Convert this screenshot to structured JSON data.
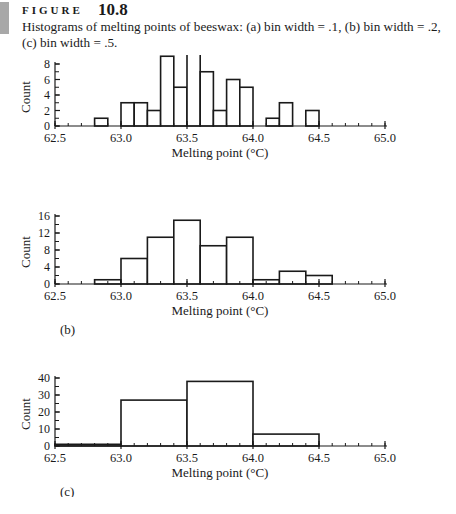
{
  "figure": {
    "label": "FIGURE",
    "number": "10.8",
    "caption": "Histograms of melting points of beeswax: (a) bin width = .1, (b) bin width = .2, (c) bin width = .5."
  },
  "chart_data": [
    {
      "type": "bar",
      "panel": "(a)",
      "title": "",
      "xlabel": "Melting point (°C)",
      "ylabel": "Count",
      "bin_width": 0.1,
      "xlim": [
        62.5,
        65.0
      ],
      "ylim": [
        0,
        10
      ],
      "x_ticks": [
        "62.5",
        "63.0",
        "63.5",
        "64.0",
        "64.5",
        "65.0"
      ],
      "y_ticks": [
        "0",
        "2",
        "4",
        "6",
        "8"
      ],
      "bins": [
        {
          "start": 62.8,
          "count": 1
        },
        {
          "start": 63.0,
          "count": 3
        },
        {
          "start": 63.1,
          "count": 3
        },
        {
          "start": 63.2,
          "count": 2
        },
        {
          "start": 63.3,
          "count": 9
        },
        {
          "start": 63.4,
          "count": 5
        },
        {
          "start": 63.5,
          "count": 10
        },
        {
          "start": 63.6,
          "count": 7
        },
        {
          "start": 63.7,
          "count": 2
        },
        {
          "start": 63.8,
          "count": 6
        },
        {
          "start": 63.9,
          "count": 5
        },
        {
          "start": 64.1,
          "count": 1
        },
        {
          "start": 64.2,
          "count": 3
        },
        {
          "start": 64.4,
          "count": 2
        }
      ]
    },
    {
      "type": "bar",
      "panel": "(b)",
      "title": "",
      "xlabel": "Melting point (°C)",
      "ylabel": "Count",
      "bin_width": 0.2,
      "xlim": [
        62.5,
        65.0
      ],
      "ylim": [
        0,
        16
      ],
      "x_ticks": [
        "62.5",
        "63.0",
        "63.5",
        "64.0",
        "64.5",
        "65.0"
      ],
      "y_ticks": [
        "0",
        "4",
        "8",
        "12",
        "16"
      ],
      "bins": [
        {
          "start": 62.8,
          "count": 1
        },
        {
          "start": 63.0,
          "count": 6
        },
        {
          "start": 63.2,
          "count": 11
        },
        {
          "start": 63.4,
          "count": 15
        },
        {
          "start": 63.6,
          "count": 9
        },
        {
          "start": 63.8,
          "count": 11
        },
        {
          "start": 64.0,
          "count": 1
        },
        {
          "start": 64.2,
          "count": 3
        },
        {
          "start": 64.4,
          "count": 2
        }
      ]
    },
    {
      "type": "bar",
      "panel": "(c)",
      "title": "",
      "xlabel": "Melting point (°C)",
      "ylabel": "Count",
      "bin_width": 0.5,
      "xlim": [
        62.5,
        65.0
      ],
      "ylim": [
        0,
        40
      ],
      "x_ticks": [
        "62.5",
        "63.0",
        "63.5",
        "64.0",
        "64.5",
        "65.0"
      ],
      "y_ticks": [
        "0",
        "10",
        "20",
        "30",
        "40"
      ],
      "bins": [
        {
          "start": 62.5,
          "count": 1
        },
        {
          "start": 63.0,
          "count": 27
        },
        {
          "start": 63.5,
          "count": 38
        },
        {
          "start": 64.0,
          "count": 7
        }
      ]
    }
  ]
}
